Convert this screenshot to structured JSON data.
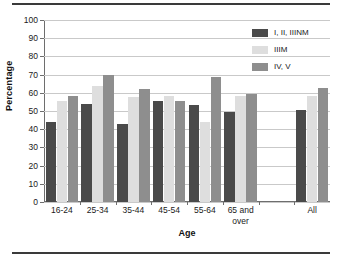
{
  "chart_data": {
    "type": "bar",
    "title": "",
    "xlabel": "Age",
    "ylabel": "Percentage",
    "ylim": [
      0,
      100
    ],
    "yticks": [
      0,
      10,
      20,
      30,
      40,
      50,
      60,
      70,
      80,
      90,
      100
    ],
    "ytick_labels": [
      "0",
      "10",
      "20",
      "30",
      "40",
      "50",
      "60",
      "70",
      "80",
      "90",
      "100"
    ],
    "grid": true,
    "legend_position": "top-right",
    "categories": [
      "16-24",
      "25-34",
      "35-44",
      "45-54",
      "55-64",
      "65 and over",
      "",
      "All"
    ],
    "series": [
      {
        "name": "I, II, IIINM",
        "color": "#4a4a4a",
        "values": [
          44,
          54,
          43,
          55.5,
          53.5,
          49.5,
          null,
          50.5
        ]
      },
      {
        "name": "IIIM",
        "color": "#dedede",
        "values": [
          55.5,
          64,
          57.5,
          58,
          44,
          58,
          null,
          58
        ]
      },
      {
        "name": "IV, V",
        "color": "#8e8e8e",
        "values": [
          58,
          70,
          62,
          55.5,
          68.5,
          59.5,
          null,
          62.5
        ]
      }
    ]
  },
  "axis": {
    "y_title": "Percentage",
    "x_title": "Age"
  },
  "colors": {
    "series_1": "#4a4a4a",
    "series_2": "#dedede",
    "series_3": "#8e8e8e",
    "gridline": "#c9c9c9",
    "axis": "#6e6e6e",
    "rule": "#3a3a3a",
    "background": "#ffffff"
  }
}
